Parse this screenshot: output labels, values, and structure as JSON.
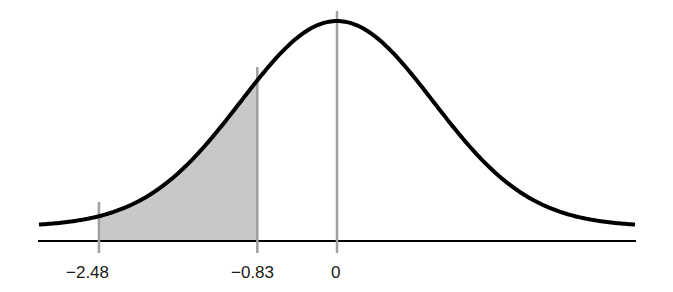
{
  "chart_data": {
    "type": "area",
    "title": "",
    "subtitle": "",
    "xlabel": "",
    "ylabel": "",
    "distribution": {
      "name": "standard normal",
      "mean": 0,
      "std": 1
    },
    "x_range": [
      -3.1,
      3.1
    ],
    "shaded_region": {
      "from": -2.48,
      "to": -0.83,
      "fill": "#c8c8c8"
    },
    "reference_lines": [
      {
        "x": -2.48,
        "label": "−2.48"
      },
      {
        "x": -0.83,
        "label": "−0.83"
      },
      {
        "x": 0,
        "label": "0"
      }
    ],
    "tick_labels": [
      "−2.48",
      "−0.83",
      "0"
    ],
    "grid": false,
    "legend": null
  },
  "colors": {
    "curve": "#000000",
    "axis": "#000000",
    "reference_line": "#a0a0a0",
    "shade": "#c8c8c8",
    "background": "#ffffff"
  },
  "layout": {
    "center_px": 337,
    "px_per_sd": 96,
    "baseline_px": 228,
    "peak_px": 25,
    "axis_y_px": 241,
    "left_px": 39,
    "right_px": 636
  }
}
